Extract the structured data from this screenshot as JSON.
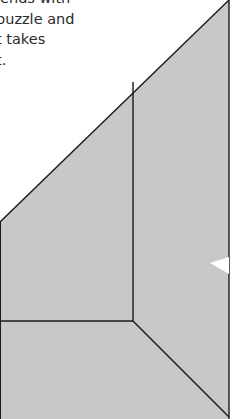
{
  "caption": {
    "lines": [
      "iends with",
      "puzzle and",
      "t takes",
      "t."
    ]
  },
  "diagram": {
    "fill_color": "#c8c8c8",
    "stroke_color": "#1a1a1a",
    "pieces": [
      {
        "name": "upper-left-triangle-piece"
      },
      {
        "name": "upper-right-tall-piece"
      },
      {
        "name": "bottom-left-rectangle-piece"
      },
      {
        "name": "bottom-right-triangle-piece"
      }
    ]
  }
}
